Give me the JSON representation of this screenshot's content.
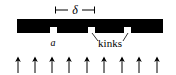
{
  "figure": {
    "type": "schematic-diagram",
    "background_color": "#ffffff",
    "ink_color": "#000000",
    "width": 176,
    "height": 75
  },
  "dimension_bracket": {
    "label": "δ",
    "label_style": "italic",
    "x_start": 55,
    "x_end": 95,
    "y": 10,
    "cap_height": 7,
    "label_x": 75,
    "label_y": 13
  },
  "slab": {
    "x": 17,
    "y": 19,
    "width": 146,
    "height": 14,
    "color": "#000000"
  },
  "kinks": {
    "label": "kinks",
    "label_x": 110,
    "label_y": 46,
    "notch_width": 7,
    "notch_height": 6,
    "notch_color": "#ffffff",
    "positions": [
      50,
      88,
      124
    ],
    "leader_lines": [
      {
        "x1": 92,
        "y1": 33,
        "x2": 98,
        "y2": 41
      },
      {
        "x1": 128,
        "y1": 33,
        "x2": 123,
        "y2": 41
      }
    ]
  },
  "spacing_label": {
    "label": "a",
    "label_style": "italic",
    "x": 53,
    "y": 46
  },
  "arrows": {
    "count": 9,
    "direction": "up",
    "color": "#000000",
    "y_tail": 73,
    "y_head": 57,
    "x_positions": [
      18,
      35,
      52,
      69,
      87,
      104,
      122,
      139,
      157
    ]
  }
}
